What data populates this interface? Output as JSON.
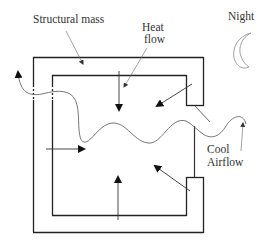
{
  "diagram": {
    "labels": {
      "structural_mass": "Structural mass",
      "heat_flow_line1": "Heat",
      "heat_flow_line2": "flow",
      "night": "Night",
      "cool_airflow_line1": "Cool",
      "cool_airflow_line2": "Airflow"
    },
    "icons": {
      "night_symbol": "crescent-moon-icon"
    },
    "colors": {
      "wall": "#222222",
      "arrow": "#111111",
      "thin_line": "#555555",
      "airflow": "#666666",
      "moon": "#888888",
      "text": "#333333",
      "background": "#ffffff"
    },
    "elements": [
      "outer wall (thick structural mass)",
      "inner wall",
      "top-right and bottom-right wall piers",
      "window/opening on right side",
      "opening on left side (dashed)",
      "5 heat-flow arrows from mass into room",
      "wavy cool airflow line entering right, exiting left",
      "crescent moon"
    ]
  }
}
